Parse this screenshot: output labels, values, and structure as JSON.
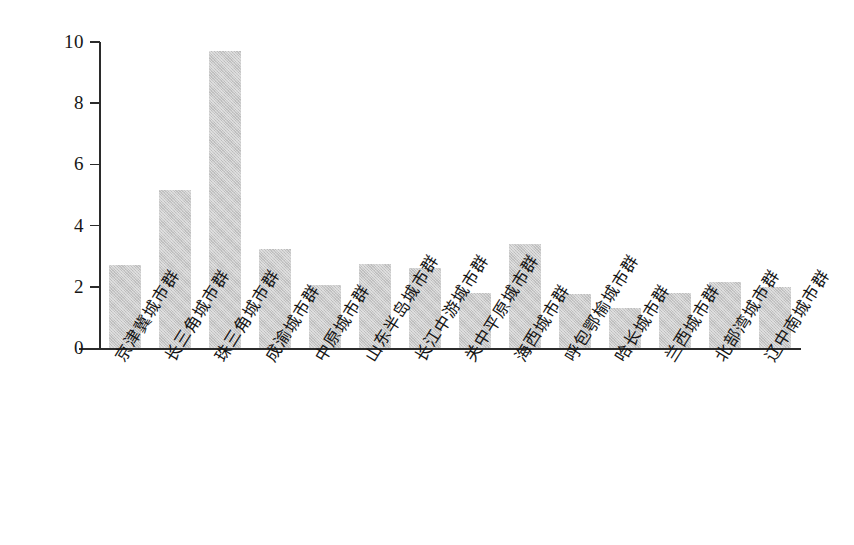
{
  "chart_data": {
    "type": "bar",
    "title": "",
    "subtitle": "",
    "xlabel": "",
    "ylabel": "",
    "ylim": [
      0,
      10
    ],
    "yticks": [
      0,
      2,
      4,
      6,
      8,
      10
    ],
    "ytick_labels": [
      "0",
      "2",
      "4",
      "6",
      "8",
      "10"
    ],
    "grid": false,
    "legend": null,
    "bar_color": "#c9c9c9",
    "axis_color": "#2b2b2b",
    "categories": [
      "京津冀城市群",
      "长三角城市群",
      "珠三角城市群",
      "成渝城市群",
      "中原城市群",
      "山东半岛城市群",
      "长江中游城市群",
      "关中平原城市群",
      "海西城市群",
      "呼包鄂榆城市群",
      "哈长城市群",
      "兰西城市群",
      "北部湾城市群",
      "辽中南城市群"
    ],
    "values": [
      2.7,
      5.15,
      9.7,
      3.25,
      2.05,
      2.75,
      2.6,
      1.8,
      3.4,
      1.75,
      1.3,
      1.8,
      2.15,
      2.0
    ]
  }
}
